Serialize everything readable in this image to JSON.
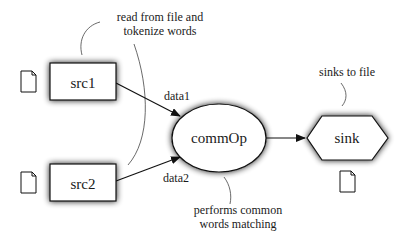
{
  "diagram": {
    "nodes": [
      {
        "id": "src1",
        "label": "src1",
        "shape": "rectangle"
      },
      {
        "id": "src2",
        "label": "src2",
        "shape": "rectangle"
      },
      {
        "id": "commOp",
        "label": "commOp",
        "shape": "ellipse"
      },
      {
        "id": "sink",
        "label": "sink",
        "shape": "hexagon"
      }
    ],
    "edges": [
      {
        "from": "src1",
        "to": "commOp",
        "label": "data1"
      },
      {
        "from": "src2",
        "to": "commOp",
        "label": "data2"
      },
      {
        "from": "commOp",
        "to": "sink",
        "label": ""
      }
    ],
    "annotations": {
      "sources": {
        "line1": "read from file and",
        "line2": "tokenize words"
      },
      "sink": {
        "line1": "sinks to file"
      },
      "commOp": {
        "line1": "performs common",
        "line2": "words matching"
      }
    },
    "icons": [
      "file-icon",
      "file-icon",
      "file-icon"
    ],
    "colors": {
      "stroke": "#111111",
      "fill": "#ffffff",
      "shadow": "#555555"
    }
  }
}
